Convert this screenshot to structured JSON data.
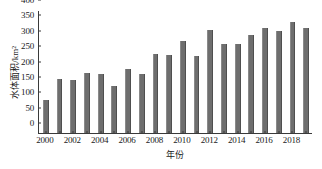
{
  "chart_data": {
    "type": "bar",
    "title": "",
    "xlabel": "年份",
    "ylabel": "水体面积/km²",
    "categories": [
      "2000",
      "2001",
      "2002",
      "2003",
      "2004",
      "2005",
      "2006",
      "2007",
      "2008",
      "2009",
      "2010",
      "2011",
      "2012",
      "2013",
      "2014",
      "2015",
      "2016",
      "2017",
      "2018",
      "2019"
    ],
    "values": [
      107,
      175,
      171,
      194,
      192,
      153,
      209,
      192,
      258,
      253,
      299,
      252,
      336,
      288,
      290,
      320,
      342,
      331,
      362,
      340
    ],
    "ylim": [
      0,
      400
    ],
    "yticks": [
      0,
      50,
      100,
      150,
      200,
      250,
      300,
      350,
      400
    ],
    "ytick_labels": [
      "0",
      "50",
      "100",
      "150",
      "200",
      "250",
      "300",
      "350",
      "400"
    ],
    "xtick_labels": [
      "2000",
      "2002",
      "2004",
      "2006",
      "2008",
      "2010",
      "2012",
      "2014",
      "2016",
      "2018"
    ],
    "xtick_categories": [
      "2000",
      "2002",
      "2004",
      "2006",
      "2008",
      "2010",
      "2012",
      "2014",
      "2016",
      "2018"
    ],
    "grid": false,
    "legend": null,
    "legend_position": "none",
    "bar_color": "#6e6e6e",
    "axis_color": "#3a3a3a",
    "background_color": "#ffffff"
  }
}
